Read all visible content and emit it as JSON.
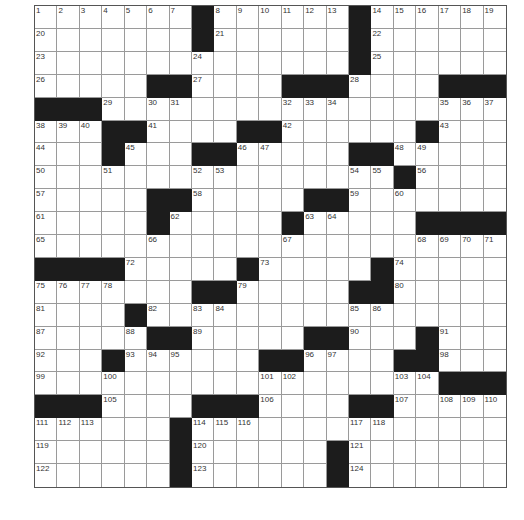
{
  "puzzle": {
    "rows": 21,
    "cols": 21,
    "layout": [
      ".......#......#......",
      ".......#......#......",
      "..............#......",
      ".....##....###....###",
      "###..................",
      "...##....##......#...",
      "...#...##.....##.....",
      "................#....",
      ".....##.....##.......",
      ".....#.....#.....####",
      ".....................",
      "####.....#.....#.....",
      ".......##.....##.....",
      "....#................",
      ".....##.....##...#...",
      "...#......##....##...",
      "..................###",
      "###....###....##.....",
      "......#..............",
      "......#......#.......",
      "......#......#......."
    ],
    "numbers": [
      {
        "r": 0,
        "c": 0,
        "n": "1"
      },
      {
        "r": 0,
        "c": 1,
        "n": "2"
      },
      {
        "r": 0,
        "c": 2,
        "n": "3"
      },
      {
        "r": 0,
        "c": 3,
        "n": "4"
      },
      {
        "r": 0,
        "c": 4,
        "n": "5"
      },
      {
        "r": 0,
        "c": 5,
        "n": "6"
      },
      {
        "r": 0,
        "c": 6,
        "n": "7"
      },
      {
        "r": 0,
        "c": 8,
        "n": "8"
      },
      {
        "r": 0,
        "c": 9,
        "n": "9"
      },
      {
        "r": 0,
        "c": 10,
        "n": "10"
      },
      {
        "r": 0,
        "c": 11,
        "n": "11"
      },
      {
        "r": 0,
        "c": 12,
        "n": "12"
      },
      {
        "r": 0,
        "c": 13,
        "n": "13"
      },
      {
        "r": 0,
        "c": 15,
        "n": "14"
      },
      {
        "r": 0,
        "c": 16,
        "n": "15"
      },
      {
        "r": 0,
        "c": 17,
        "n": "16"
      },
      {
        "r": 0,
        "c": 18,
        "n": "17"
      },
      {
        "r": 0,
        "c": 19,
        "n": "18"
      },
      {
        "r": 0,
        "c": 20,
        "n": "19"
      },
      {
        "r": 1,
        "c": 0,
        "n": "20"
      },
      {
        "r": 1,
        "c": 8,
        "n": "21"
      },
      {
        "r": 1,
        "c": 15,
        "n": "22"
      },
      {
        "r": 2,
        "c": 0,
        "n": "23"
      },
      {
        "r": 2,
        "c": 7,
        "n": "24"
      },
      {
        "r": 2,
        "c": 15,
        "n": "25"
      },
      {
        "r": 3,
        "c": 0,
        "n": "26"
      },
      {
        "r": 3,
        "c": 7,
        "n": "27"
      },
      {
        "r": 3,
        "c": 14,
        "n": "28"
      },
      {
        "r": 4,
        "c": 3,
        "n": "29"
      },
      {
        "r": 4,
        "c": 5,
        "n": "30"
      },
      {
        "r": 4,
        "c": 6,
        "n": "31"
      },
      {
        "r": 4,
        "c": 11,
        "n": "32"
      },
      {
        "r": 4,
        "c": 12,
        "n": "33"
      },
      {
        "r": 4,
        "c": 13,
        "n": "34"
      },
      {
        "r": 4,
        "c": 18,
        "n": "35"
      },
      {
        "r": 4,
        "c": 19,
        "n": "36"
      },
      {
        "r": 4,
        "c": 20,
        "n": "37"
      },
      {
        "r": 5,
        "c": 0,
        "n": "38"
      },
      {
        "r": 5,
        "c": 1,
        "n": "39"
      },
      {
        "r": 5,
        "c": 2,
        "n": "40"
      },
      {
        "r": 5,
        "c": 5,
        "n": "41"
      },
      {
        "r": 5,
        "c": 11,
        "n": "42"
      },
      {
        "r": 5,
        "c": 18,
        "n": "43"
      },
      {
        "r": 6,
        "c": 0,
        "n": "44"
      },
      {
        "r": 6,
        "c": 4,
        "n": "45"
      },
      {
        "r": 6,
        "c": 9,
        "n": "46"
      },
      {
        "r": 6,
        "c": 10,
        "n": "47"
      },
      {
        "r": 6,
        "c": 16,
        "n": "48"
      },
      {
        "r": 6,
        "c": 17,
        "n": "49"
      },
      {
        "r": 7,
        "c": 0,
        "n": "50"
      },
      {
        "r": 7,
        "c": 3,
        "n": "51"
      },
      {
        "r": 7,
        "c": 7,
        "n": "52"
      },
      {
        "r": 7,
        "c": 8,
        "n": "53"
      },
      {
        "r": 7,
        "c": 14,
        "n": "54"
      },
      {
        "r": 7,
        "c": 15,
        "n": "55"
      },
      {
        "r": 7,
        "c": 17,
        "n": "56"
      },
      {
        "r": 8,
        "c": 0,
        "n": "57"
      },
      {
        "r": 8,
        "c": 7,
        "n": "58"
      },
      {
        "r": 8,
        "c": 14,
        "n": "59"
      },
      {
        "r": 8,
        "c": 16,
        "n": "60"
      },
      {
        "r": 9,
        "c": 0,
        "n": "61"
      },
      {
        "r": 9,
        "c": 6,
        "n": "62"
      },
      {
        "r": 9,
        "c": 12,
        "n": "63"
      },
      {
        "r": 9,
        "c": 13,
        "n": "64"
      },
      {
        "r": 10,
        "c": 0,
        "n": "65"
      },
      {
        "r": 10,
        "c": 5,
        "n": "66"
      },
      {
        "r": 10,
        "c": 11,
        "n": "67"
      },
      {
        "r": 10,
        "c": 17,
        "n": "68"
      },
      {
        "r": 10,
        "c": 18,
        "n": "69"
      },
      {
        "r": 10,
        "c": 19,
        "n": "70"
      },
      {
        "r": 10,
        "c": 20,
        "n": "71"
      },
      {
        "r": 11,
        "c": 4,
        "n": "72"
      },
      {
        "r": 11,
        "c": 10,
        "n": "73"
      },
      {
        "r": 11,
        "c": 16,
        "n": "74"
      },
      {
        "r": 12,
        "c": 0,
        "n": "75"
      },
      {
        "r": 12,
        "c": 1,
        "n": "76"
      },
      {
        "r": 12,
        "c": 2,
        "n": "77"
      },
      {
        "r": 12,
        "c": 3,
        "n": "78"
      },
      {
        "r": 12,
        "c": 9,
        "n": "79"
      },
      {
        "r": 12,
        "c": 16,
        "n": "80"
      },
      {
        "r": 13,
        "c": 0,
        "n": "81"
      },
      {
        "r": 13,
        "c": 5,
        "n": "82"
      },
      {
        "r": 13,
        "c": 7,
        "n": "83"
      },
      {
        "r": 13,
        "c": 8,
        "n": "84"
      },
      {
        "r": 13,
        "c": 14,
        "n": "85"
      },
      {
        "r": 13,
        "c": 15,
        "n": "86"
      },
      {
        "r": 14,
        "c": 0,
        "n": "87"
      },
      {
        "r": 14,
        "c": 4,
        "n": "88"
      },
      {
        "r": 14,
        "c": 7,
        "n": "89"
      },
      {
        "r": 14,
        "c": 14,
        "n": "90"
      },
      {
        "r": 14,
        "c": 18,
        "n": "91"
      },
      {
        "r": 15,
        "c": 0,
        "n": "92"
      },
      {
        "r": 15,
        "c": 4,
        "n": "93"
      },
      {
        "r": 15,
        "c": 5,
        "n": "94"
      },
      {
        "r": 15,
        "c": 6,
        "n": "95"
      },
      {
        "r": 15,
        "c": 12,
        "n": "96"
      },
      {
        "r": 15,
        "c": 13,
        "n": "97"
      },
      {
        "r": 15,
        "c": 18,
        "n": "98"
      },
      {
        "r": 16,
        "c": 0,
        "n": "99"
      },
      {
        "r": 16,
        "c": 3,
        "n": "100"
      },
      {
        "r": 16,
        "c": 10,
        "n": "101"
      },
      {
        "r": 16,
        "c": 11,
        "n": "102"
      },
      {
        "r": 16,
        "c": 16,
        "n": "103"
      },
      {
        "r": 16,
        "c": 17,
        "n": "104"
      },
      {
        "r": 17,
        "c": 3,
        "n": "105"
      },
      {
        "r": 17,
        "c": 10,
        "n": "106"
      },
      {
        "r": 17,
        "c": 16,
        "n": "107"
      },
      {
        "r": 17,
        "c": 18,
        "n": "108"
      },
      {
        "r": 17,
        "c": 19,
        "n": "109"
      },
      {
        "r": 17,
        "c": 20,
        "n": "110"
      },
      {
        "r": 18,
        "c": 0,
        "n": "111"
      },
      {
        "r": 18,
        "c": 1,
        "n": "112"
      },
      {
        "r": 18,
        "c": 2,
        "n": "113"
      },
      {
        "r": 18,
        "c": 7,
        "n": "114"
      },
      {
        "r": 18,
        "c": 8,
        "n": "115"
      },
      {
        "r": 18,
        "c": 9,
        "n": "116"
      },
      {
        "r": 18,
        "c": 14,
        "n": "117"
      },
      {
        "r": 18,
        "c": 15,
        "n": "118"
      },
      {
        "r": 19,
        "c": 0,
        "n": "119"
      },
      {
        "r": 19,
        "c": 7,
        "n": "120"
      },
      {
        "r": 19,
        "c": 14,
        "n": "121"
      },
      {
        "r": 20,
        "c": 0,
        "n": "122"
      },
      {
        "r": 20,
        "c": 7,
        "n": "123"
      },
      {
        "r": 20,
        "c": 14,
        "n": "124"
      }
    ]
  },
  "colors": {
    "black_square": "#1c1c1c",
    "white_square": "#ffffff",
    "grid_line": "#9a9a9a"
  }
}
